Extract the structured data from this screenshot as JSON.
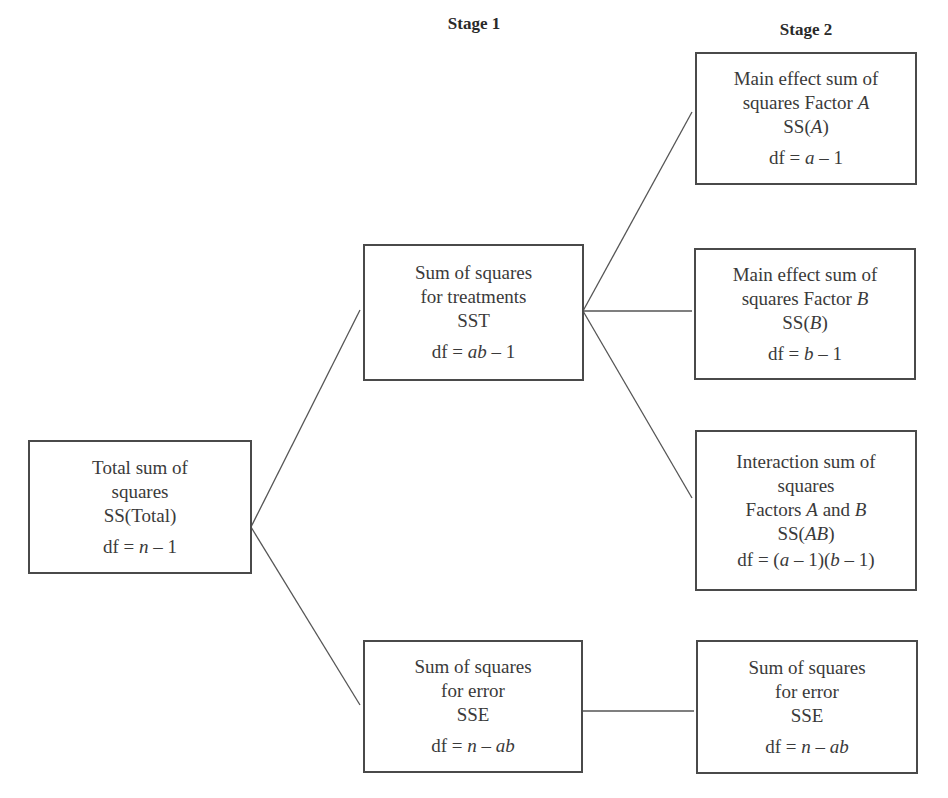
{
  "headers": {
    "stage1": "Stage 1",
    "stage2": "Stage 2"
  },
  "boxes": {
    "total": {
      "lines": [
        "Total sum of",
        "squares",
        "SS(Total)"
      ],
      "df": {
        "prefix": "df = ",
        "expr": "n",
        "suffix": " – 1"
      }
    },
    "treatments": {
      "lines": [
        "Sum of squares",
        "for treatments",
        "SST"
      ],
      "df": {
        "prefix": "df = ",
        "expr": "ab",
        "suffix": " – 1"
      }
    },
    "error_stage1": {
      "lines": [
        "Sum of squares",
        "for error",
        "SSE"
      ],
      "df": {
        "prefix": "df = ",
        "expr": "n",
        "suffix": " – ",
        "expr2": "ab"
      }
    },
    "factor_a": {
      "lines": [
        "Main effect sum of"
      ],
      "line2": {
        "text": "squares Factor ",
        "var": "A"
      },
      "ss": {
        "prefix": "SS(",
        "var": "A",
        "suffix": ")"
      },
      "df": {
        "prefix": "df = ",
        "expr": "a",
        "suffix": " – 1"
      }
    },
    "factor_b": {
      "lines": [
        "Main effect sum of"
      ],
      "line2": {
        "text": "squares Factor ",
        "var": "B"
      },
      "ss": {
        "prefix": "SS(",
        "var": "B",
        "suffix": ")"
      },
      "df": {
        "prefix": "df = ",
        "expr": "b",
        "suffix": " – 1"
      }
    },
    "interaction": {
      "lines": [
        "Interaction sum of",
        "squares"
      ],
      "line3": {
        "text1": "Factors ",
        "var1": "A",
        "text2": " and ",
        "var2": "B"
      },
      "ss": {
        "prefix": "SS(",
        "var": "AB",
        "suffix": ")"
      },
      "df": {
        "prefix": "df = (",
        "expr": "a",
        "mid": " – 1)(",
        "expr2": "b",
        "suffix": " – 1)"
      }
    },
    "error_stage2": {
      "lines": [
        "Sum of squares",
        "for error",
        "SSE"
      ],
      "df": {
        "prefix": "df = ",
        "expr": "n",
        "suffix": " – ",
        "expr2": "ab"
      }
    }
  },
  "colors": {
    "box_border": "#4a4a4a",
    "line": "#555555",
    "text": "#3a3a3a"
  }
}
